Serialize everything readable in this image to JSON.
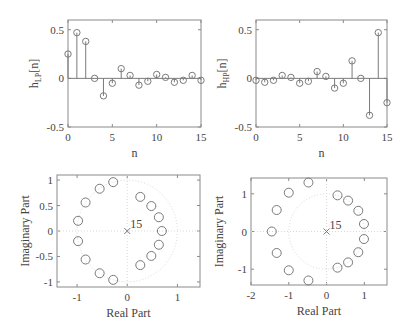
{
  "chart_data": [
    {
      "type": "stem",
      "id": "lowpass",
      "title": "",
      "xlabel": "n",
      "ylabel": "h_LP[n]",
      "ylabel_main": "h",
      "ylabel_sub": "LP",
      "ylabel_tail": "[n]",
      "xlim": [
        0,
        15
      ],
      "ylim": [
        -0.5,
        0.6
      ],
      "xticks": [
        0,
        5,
        10,
        15
      ],
      "xtick_labels": [
        "0",
        "5",
        "10",
        "15"
      ],
      "yticks": [
        0.5,
        0,
        -0.5
      ],
      "ytick_labels": [
        "0.5",
        "0",
        "-0.5"
      ],
      "x": [
        0,
        1,
        2,
        3,
        4,
        5,
        6,
        7,
        8,
        9,
        10,
        11,
        12,
        13,
        14,
        15
      ],
      "values": [
        0.25,
        0.47,
        0.38,
        0.0,
        -0.18,
        -0.05,
        0.1,
        0.03,
        -0.07,
        -0.03,
        0.04,
        0.01,
        -0.04,
        -0.02,
        0.03,
        -0.02
      ],
      "grid": false
    },
    {
      "type": "stem",
      "id": "highpass",
      "title": "",
      "xlabel": "n",
      "ylabel": "h_HP[n]",
      "ylabel_main": "h",
      "ylabel_sub": "HP",
      "ylabel_tail": "[n]",
      "xlim": [
        0,
        15
      ],
      "ylim": [
        -0.5,
        0.6
      ],
      "xticks": [
        0,
        5,
        10,
        15
      ],
      "xtick_labels": [
        "0",
        "5",
        "10",
        "15"
      ],
      "yticks": [
        0.5,
        0,
        -0.5
      ],
      "ytick_labels": [
        "0.5",
        "0",
        "-0.5"
      ],
      "x": [
        0,
        1,
        2,
        3,
        4,
        5,
        6,
        7,
        8,
        9,
        10,
        11,
        12,
        13,
        14,
        15
      ],
      "values": [
        -0.02,
        -0.04,
        -0.02,
        0.03,
        0.01,
        -0.05,
        -0.03,
        0.07,
        0.02,
        -0.1,
        -0.05,
        0.18,
        0.0,
        -0.38,
        0.47,
        -0.25
      ],
      "grid": false
    },
    {
      "type": "scatter",
      "id": "lowpass-zplane",
      "title": "",
      "xlabel": "Real Part",
      "ylabel": "Imaginary Part",
      "xlim": [
        -1.4,
        1.45
      ],
      "ylim": [
        -1.1,
        1.1
      ],
      "xticks": [
        -1,
        0,
        1
      ],
      "xtick_labels": [
        "-1",
        "0",
        "1"
      ],
      "yticks": [
        1,
        0.5,
        0,
        -0.5,
        -1
      ],
      "ytick_labels": [
        "1",
        "0.5",
        "0",
        "-0.5",
        "-1"
      ],
      "zeros": [
        [
          -0.28,
          0.96
        ],
        [
          -0.55,
          0.83
        ],
        [
          -0.83,
          0.56
        ],
        [
          -0.98,
          0.2
        ],
        [
          -0.98,
          -0.2
        ],
        [
          -0.83,
          -0.56
        ],
        [
          -0.55,
          -0.83
        ],
        [
          -0.28,
          -0.96
        ],
        [
          0.26,
          0.67
        ],
        [
          0.48,
          0.49
        ],
        [
          0.63,
          0.27
        ],
        [
          0.69,
          0.0
        ],
        [
          0.63,
          -0.27
        ],
        [
          0.48,
          -0.49
        ],
        [
          0.26,
          -0.67
        ]
      ],
      "poles": [
        [
          0,
          0
        ]
      ],
      "pole_multiplicity_label": "15",
      "unit_circle": true
    },
    {
      "type": "scatter",
      "id": "highpass-zplane",
      "title": "",
      "xlabel": "Real Part",
      "ylabel": "Imaginary Part",
      "xlim": [
        -2,
        1.6
      ],
      "ylim": [
        -1.42,
        1.42
      ],
      "xticks": [
        -2,
        -1,
        0,
        1
      ],
      "xtick_labels": [
        "-2",
        "-1",
        "0",
        "1"
      ],
      "yticks": [
        1,
        0,
        -1
      ],
      "ytick_labels": [
        "1",
        "0",
        "-1"
      ],
      "zeros": [
        [
          -0.48,
          1.3
        ],
        [
          -1.0,
          1.03
        ],
        [
          -1.32,
          0.57
        ],
        [
          -1.45,
          0.0
        ],
        [
          -1.32,
          -0.57
        ],
        [
          -1.0,
          -1.03
        ],
        [
          -0.48,
          -1.3
        ],
        [
          0.29,
          0.96
        ],
        [
          0.57,
          0.82
        ],
        [
          0.84,
          0.55
        ],
        [
          0.99,
          0.2
        ],
        [
          0.99,
          -0.2
        ],
        [
          0.84,
          -0.55
        ],
        [
          0.57,
          -0.82
        ],
        [
          0.29,
          -0.96
        ]
      ],
      "poles": [
        [
          0,
          0
        ]
      ],
      "pole_multiplicity_label": "15",
      "unit_circle": true
    }
  ],
  "colors": {
    "frame": "#8a8a8a",
    "marker": "#7a7a7a",
    "text": "#444444",
    "dotted": "#d8d8d8"
  }
}
